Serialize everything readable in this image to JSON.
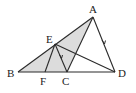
{
  "figure": {
    "type": "geometry-diagram",
    "shading_color": "#dcdcdc",
    "line_color": "#2a2a2a",
    "points": {
      "A": {
        "label": "A",
        "x": 93,
        "y": 17,
        "lx": 89,
        "ly": 13
      },
      "B": {
        "label": "B",
        "x": 18,
        "y": 72,
        "lx": 7,
        "ly": 77
      },
      "C": {
        "label": "C",
        "x": 67,
        "y": 72,
        "lx": 62,
        "ly": 85
      },
      "D": {
        "label": "D",
        "x": 115,
        "y": 72,
        "lx": 118,
        "ly": 77
      },
      "E": {
        "label": "E",
        "x": 55,
        "y": 44,
        "lx": 46,
        "ly": 43
      },
      "F": {
        "label": "F",
        "x": 45,
        "y": 72,
        "lx": 40,
        "ly": 85
      }
    },
    "shaded_region": [
      "B",
      "A",
      "C"
    ],
    "segments": [
      [
        "B",
        "A"
      ],
      [
        "A",
        "C"
      ],
      [
        "A",
        "D"
      ],
      [
        "B",
        "D"
      ],
      [
        "E",
        "F"
      ],
      [
        "E",
        "C"
      ],
      [
        "E",
        "D"
      ]
    ],
    "parallel_arrows": [
      [
        "E",
        "C"
      ],
      [
        "A",
        "D"
      ]
    ]
  }
}
